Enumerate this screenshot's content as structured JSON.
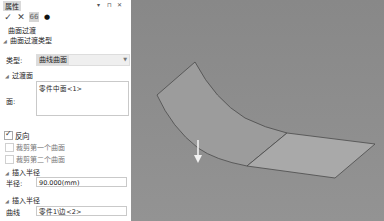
{
  "panel": {
    "title": "属性",
    "controls": {
      "pin": "▾",
      "float": "⊓",
      "close": "✕"
    },
    "toolbar": [
      {
        "name": "confirm",
        "glyph": "✓"
      },
      {
        "name": "cancel",
        "glyph": "✕"
      },
      {
        "name": "preview",
        "glyph": "66"
      },
      {
        "name": "apply",
        "glyph": "●"
      }
    ],
    "sections": {
      "surface_transition": "曲面过渡",
      "transition_type": "曲面过渡类型",
      "type_label": "类型:",
      "type_value": "曲线曲面",
      "transition_face": "过渡面",
      "face_label": "面:",
      "face_value": "零件中面<1>",
      "reverse_label": "反向",
      "reverse_checked": true,
      "trim_first": "裁剪第一个曲面",
      "trim_first_checked": false,
      "trim_second": "裁剪第二个曲面",
      "trim_second_checked": false,
      "insert_radius_1": "插入半径",
      "radius_label": "半径:",
      "radius_value": "90.000(mm)",
      "insert_radius_2": "插入半径",
      "curve_label": "曲线",
      "curve_value": "零件1\\边<2>"
    }
  },
  "viewport": {
    "background": "#8a8a8a",
    "surface_color": "#9e9e9e",
    "plane_color": "#a8a8a8",
    "edge_color": "#4a4a4a",
    "arrow_color": "#f2f2f2"
  }
}
